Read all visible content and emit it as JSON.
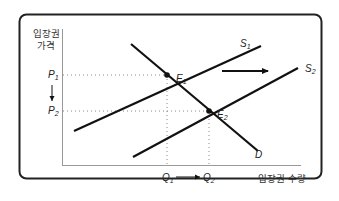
{
  "diagram": {
    "type": "supply-demand",
    "y_axis_label_line1": "입장권",
    "y_axis_label_line2": "가격",
    "x_axis_label": "입장권 수량",
    "curves": {
      "demand": {
        "label": "D"
      },
      "supply_1": {
        "label": "S",
        "sub": "1"
      },
      "supply_2": {
        "label": "S",
        "sub": "2"
      }
    },
    "equilibria": [
      {
        "label": "E",
        "sub": "1"
      },
      {
        "label": "E",
        "sub": "2"
      }
    ],
    "prices": [
      {
        "label": "P",
        "sub": "1"
      },
      {
        "label": "P",
        "sub": "2"
      }
    ],
    "quantities": [
      {
        "label": "Q",
        "sub": "1"
      },
      {
        "label": "Q",
        "sub": "2"
      }
    ],
    "annotations": {
      "supply_shift": "supply curve shifts right (S1 → S2)",
      "price_change": "P1 → P2 (price falls)",
      "quantity_change": "Q1 → Q2 (quantity rises)"
    },
    "colors": {
      "line": "#111111",
      "dotted": "#888888",
      "frame": "#222222",
      "axis": "#999999"
    }
  }
}
